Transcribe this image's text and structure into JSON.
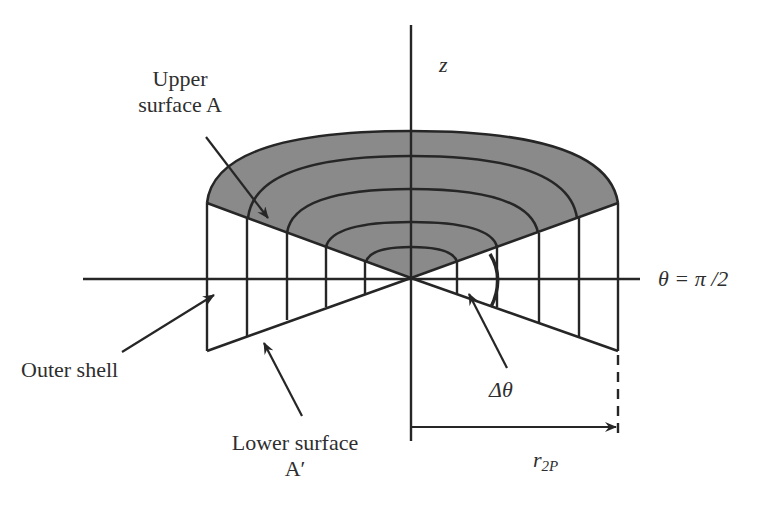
{
  "diagram": {
    "type": "geometric-figure",
    "colors": {
      "line": "#262626",
      "surface_fill": "#8a8a8a",
      "background": "#ffffff"
    },
    "labels": {
      "upper_surface": [
        "Upper",
        "surface A"
      ],
      "lower_surface": [
        "Lower surface",
        "A′"
      ],
      "outer_shell": "Outer shell",
      "z_axis": "z",
      "theta_axis": "θ = π /2",
      "delta_theta": "Δθ",
      "radius_main": "r",
      "radius_sub": "2P"
    },
    "arc_count": 5,
    "vertical_lines_per_side": 5
  }
}
